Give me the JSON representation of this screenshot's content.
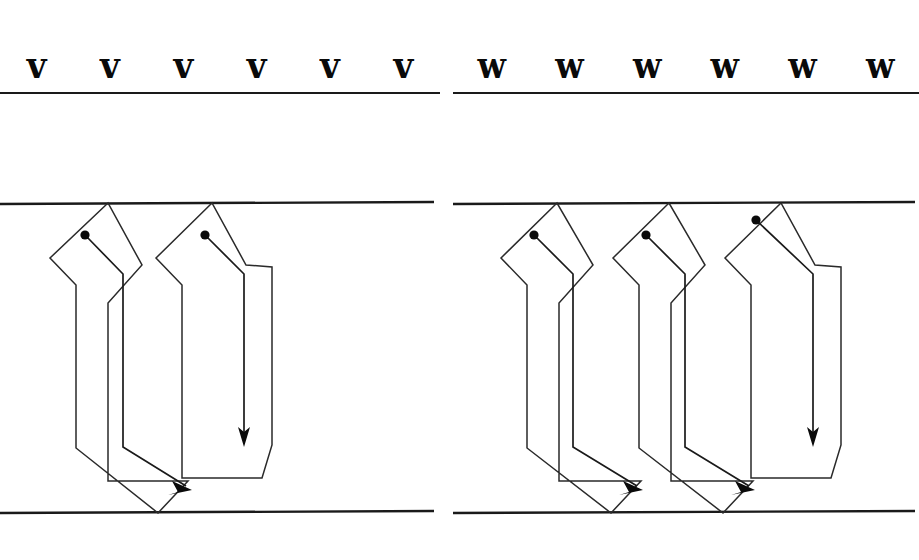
{
  "page": {
    "background_color": "#ffffff",
    "ink_color": "#1a1a1a",
    "width": 919,
    "height": 560
  },
  "exemplars": {
    "left": {
      "letter": "v",
      "glyph": "v",
      "repetitions": 6,
      "items": [
        {
          "label": "v"
        },
        {
          "label": "v"
        },
        {
          "label": "v"
        },
        {
          "label": "v"
        },
        {
          "label": "v"
        },
        {
          "label": "v"
        }
      ],
      "baseline": {
        "name": "writing-baseline"
      }
    },
    "right": {
      "letter": "w",
      "glyph": "w",
      "repetitions": 6,
      "items": [
        {
          "label": "w"
        },
        {
          "label": "w"
        },
        {
          "label": "w"
        },
        {
          "label": "w"
        },
        {
          "label": "w"
        },
        {
          "label": "w"
        }
      ],
      "baseline": {
        "name": "writing-baseline"
      }
    }
  },
  "diagrams": {
    "left": {
      "letter": "v",
      "stroke_count": 2,
      "guides": {
        "top": "x-height-line",
        "bottom": "baseline"
      },
      "strokes": [
        {
          "order": 1,
          "start_marker": "dot",
          "direction": "down-then-diagonal-right",
          "arrow": "diagonal-right"
        },
        {
          "order": 2,
          "start_marker": "dot",
          "direction": "down",
          "arrow": "down"
        }
      ]
    },
    "right": {
      "letter": "w",
      "stroke_count": 3,
      "guides": {
        "top": "x-height-line",
        "bottom": "baseline"
      },
      "strokes": [
        {
          "order": 1,
          "start_marker": "dot",
          "direction": "down-then-diagonal-right",
          "arrow": "diagonal-right"
        },
        {
          "order": 2,
          "start_marker": "dot",
          "direction": "down-then-diagonal-right",
          "arrow": "diagonal-right"
        },
        {
          "order": 3,
          "start_marker": "dot",
          "direction": "down",
          "arrow": "down"
        }
      ]
    }
  }
}
